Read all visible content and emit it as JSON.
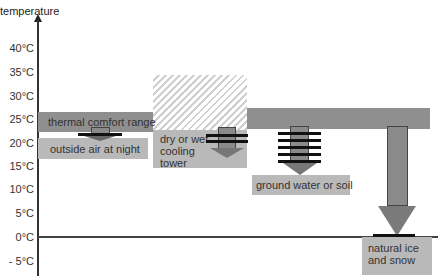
{
  "diagram": {
    "y_axis_label": "temperature",
    "ticks": [
      "40°C",
      "35°C",
      "30°C",
      "25°C",
      "20°C",
      "15°C",
      "10°C",
      "5°C",
      "0°C",
      "- 5°C"
    ],
    "labels": {
      "comfort": "thermal comfort range",
      "night_air": "outside air at night",
      "cooling_tower": "dry or wet cooling tower",
      "cooling_tower_lines": [
        "dry or wet",
        "cooling",
        "tower"
      ],
      "ground": "ground water or soil",
      "ice": "natural ice and snow",
      "ice_lines": [
        "natural ice",
        "and snow"
      ]
    },
    "colors": {
      "comfort_band": "#8f8f8f",
      "source_box": "#b9b9b9",
      "arrow": "#8a8a8a",
      "axis": "#333333"
    }
  }
}
